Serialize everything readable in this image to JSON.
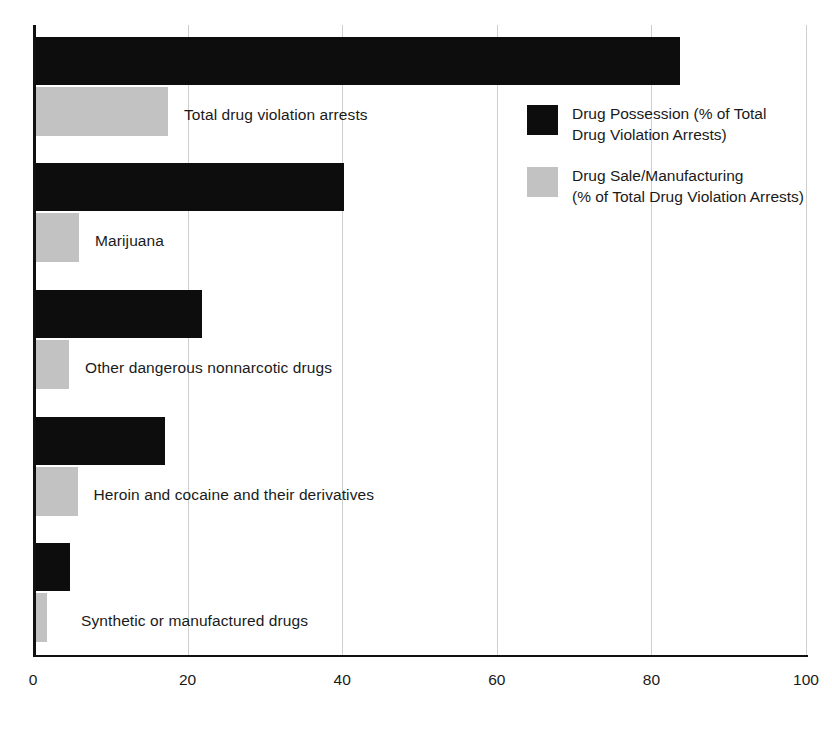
{
  "chart_data": {
    "type": "bar",
    "orientation": "horizontal",
    "title": "",
    "xlabel": "",
    "ylabel": "",
    "xlim": [
      0,
      100
    ],
    "xticks": [
      "0",
      "20",
      "40",
      "60",
      "80",
      "100"
    ],
    "grid": "vertical",
    "legend_position": "inside-right-top",
    "categories": [
      "Total drug violation arrests",
      "Marijuana",
      "Other dangerous nonnarcotic drugs",
      "Heroin and cocaine and their derivatives",
      "Synthetic or manufactured drugs"
    ],
    "series": [
      {
        "name": "Drug Possession (% of Total\nDrug Violation Arrests)",
        "short_name": "Drug Possession",
        "color": "#0d0d0d",
        "values": [
          83.5,
          40.0,
          21.6,
          16.8,
          4.5
        ]
      },
      {
        "name": "Drug Sale/Manufacturing\n(% of Total Drug Violation Arrests)",
        "short_name": "Drug Sale/Manufacturing",
        "color": "#c2c2c2",
        "values": [
          17.2,
          5.7,
          4.4,
          5.5,
          1.5
        ]
      }
    ]
  },
  "legend": {
    "items": [
      {
        "label": "Drug Possession (% of Total\nDrug Violation Arrests)",
        "swatch": "dark"
      },
      {
        "label": "Drug Sale/Manufacturing\n(% of Total Drug Violation Arrests)",
        "swatch": "light"
      }
    ]
  },
  "axis": {
    "ticks": [
      {
        "label": "0",
        "value": 0
      },
      {
        "label": "20",
        "value": 20
      },
      {
        "label": "40",
        "value": 40
      },
      {
        "label": "60",
        "value": 60
      },
      {
        "label": "80",
        "value": 80
      },
      {
        "label": "100",
        "value": 100
      }
    ]
  },
  "colors": {
    "dark_bar": "#0d0d0d",
    "light_bar": "#c2c2c2",
    "gridline": "#cfcfcf",
    "axis": "#111111",
    "text": "#1a1a1a",
    "background": "#ffffff"
  }
}
